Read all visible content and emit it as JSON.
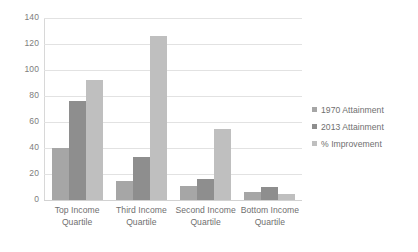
{
  "chart_data": {
    "type": "bar",
    "title": "",
    "subtitle": "",
    "xlabel": "",
    "ylabel": "",
    "categories": [
      "Top Income Quartile",
      "Third Income Quartile",
      "Second Income Quartile",
      "Bottom Income Quartile"
    ],
    "category_lines": [
      [
        "Top Income",
        "Quartile"
      ],
      [
        "Third Income",
        "Quartile"
      ],
      [
        "Second Income",
        "Quartile"
      ],
      [
        "Bottom Income",
        "Quartile"
      ]
    ],
    "series": [
      {
        "name": "1970 Attainment",
        "color": "#a6a6a6",
        "values": [
          40,
          15,
          11,
          6
        ]
      },
      {
        "name": "2013 Attainment",
        "color": "#8e8e8e",
        "values": [
          76,
          33,
          16,
          10
        ]
      },
      {
        "name": "% Improvement",
        "color": "#bfbfbf",
        "values": [
          92,
          126,
          55,
          5
        ]
      }
    ],
    "ylim": [
      0,
      140
    ],
    "yticks": [
      140,
      120,
      100,
      80,
      60,
      40,
      20,
      0
    ],
    "ytick_labels": [
      "140",
      "120",
      "100",
      "80",
      "60",
      "40",
      "20",
      "0"
    ],
    "grid": true,
    "grid_color": "#e2e2e2",
    "legend_position": "right",
    "background": "#ffffff"
  }
}
